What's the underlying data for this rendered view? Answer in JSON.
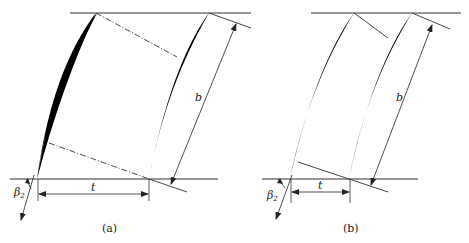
{
  "figure": {
    "panels": [
      {
        "id": "a",
        "caption": "(a)",
        "labels": {
          "chord": "b",
          "pitch": "t",
          "angle": "β",
          "angle_sub": "2"
        }
      },
      {
        "id": "b",
        "caption": "(b)",
        "labels": {
          "chord": "b",
          "pitch": "t",
          "angle": "β",
          "angle_sub": "2"
        }
      }
    ],
    "colors": {
      "stroke": "#333333",
      "blade": "#000000",
      "background": "#ffffff"
    }
  }
}
